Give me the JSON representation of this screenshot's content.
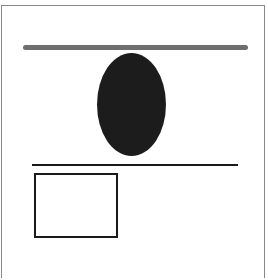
{
  "diagram": {
    "shapes": [
      {
        "type": "frame",
        "stroke": "#888888"
      },
      {
        "type": "thick-horizontal-line",
        "color": "#6e6e6e"
      },
      {
        "type": "filled-ellipse",
        "fill": "#1c1c1c"
      },
      {
        "type": "thin-horizontal-line",
        "color": "#1a1a1a"
      },
      {
        "type": "outlined-rectangle",
        "stroke": "#1a1a1a",
        "fill": "#ffffff"
      }
    ]
  }
}
